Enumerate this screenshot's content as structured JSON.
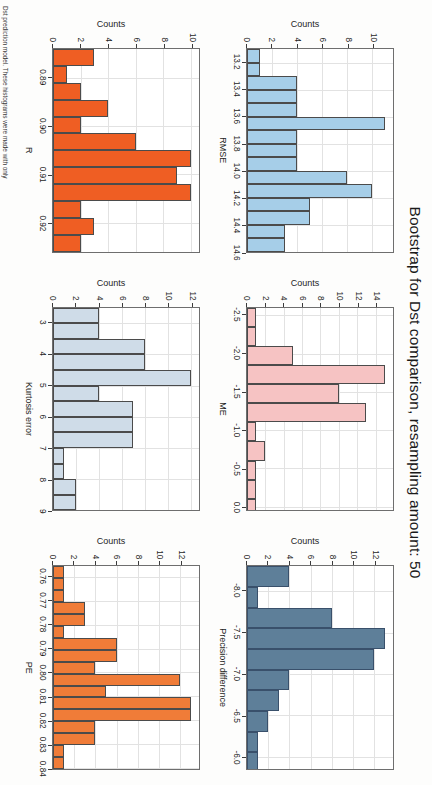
{
  "figure": {
    "title": "Bootstrap for Dst comparison, resampling amount: 50",
    "caption": "Dst prediction model. These histograms were made with only",
    "ylabel": "Counts"
  },
  "chart_data": [
    {
      "type": "bar",
      "panel_index": 0,
      "title": "",
      "xlabel": "RMSE",
      "ylabel": "Counts",
      "color": "#a6cee8",
      "border": "#4b4b4b",
      "xlim": [
        13.1,
        14.6
      ],
      "ylim": [
        0,
        11
      ],
      "yticks": [
        0,
        2,
        4,
        6,
        8,
        10
      ],
      "xticks": [
        13.2,
        13.4,
        13.6,
        13.8,
        14.0,
        14.2,
        14.4,
        14.6
      ],
      "xtick_labels": [
        "13.2",
        "13.4",
        "13.6",
        "13.8",
        "14.0",
        "14.2",
        "14.4",
        "14.6"
      ],
      "bin_width": 0.1,
      "bin_starts": [
        13.1,
        13.2,
        13.3,
        13.4,
        13.5,
        13.6,
        13.7,
        13.8,
        13.9,
        14.0,
        14.1,
        14.2,
        14.3,
        14.4,
        14.5
      ],
      "values": [
        1,
        1,
        4,
        4,
        4,
        11,
        4,
        4,
        4,
        8,
        10,
        5,
        5,
        3,
        3
      ],
      "grid": true
    },
    {
      "type": "bar",
      "panel_index": 1,
      "title": "",
      "xlabel": "ME",
      "ylabel": "Counts",
      "color": "#f6c3c3",
      "border": "#4b4b4b",
      "xlim": [
        -2.6,
        0.05
      ],
      "ylim": [
        0,
        15
      ],
      "yticks": [
        0,
        2,
        4,
        6,
        8,
        10,
        12,
        14
      ],
      "xticks": [
        -2.5,
        -2.0,
        -1.5,
        -1.0,
        -0.5,
        0.0
      ],
      "xtick_labels": [
        "-2.5",
        "-2.0",
        "-1.5",
        "-1.0",
        "-0.5",
        "0.0"
      ],
      "bin_width": 0.25,
      "bin_starts": [
        -2.6,
        -2.35,
        -2.1,
        -1.85,
        -1.6,
        -1.35,
        -1.1,
        -0.85,
        -0.6,
        -0.35,
        -0.1
      ],
      "values": [
        1,
        1,
        5,
        15,
        10,
        13,
        1,
        2,
        1,
        1,
        1
      ],
      "grid": true
    },
    {
      "type": "bar",
      "panel_index": 2,
      "title": "",
      "xlabel": "Precision difference",
      "ylabel": "Counts",
      "color": "#5e7f99",
      "border": "#39506b",
      "xlim": [
        -8.3,
        -5.85
      ],
      "ylim": [
        0,
        13
      ],
      "yticks": [
        0,
        2,
        4,
        6,
        8,
        10,
        12
      ],
      "xticks": [
        -8.0,
        -7.5,
        -7.0,
        -6.5,
        -6.0
      ],
      "xtick_labels": [
        "-8.0",
        "-7.5",
        "-7.0",
        "-6.5",
        "-6.0"
      ],
      "bin_width": 0.25,
      "bin_starts": [
        -8.3,
        -8.05,
        -7.8,
        -7.55,
        -7.3,
        -7.05,
        -6.8,
        -6.55,
        -6.3,
        -6.05
      ],
      "values": [
        4,
        1,
        8,
        13,
        12,
        4,
        3,
        2,
        1,
        1
      ],
      "grid": true
    },
    {
      "type": "bar",
      "panel_index": 3,
      "title": "",
      "xlabel": "R",
      "ylabel": "Counts",
      "color": "#ef5e23",
      "border": "#4b4b4b",
      "xlim": [
        0.884,
        0.926
      ],
      "ylim": [
        0,
        10
      ],
      "yticks": [
        0,
        2,
        4,
        6,
        8,
        10
      ],
      "xticks": [
        0.89,
        0.9,
        0.91,
        0.92
      ],
      "xtick_labels": [
        "0.89",
        "0.90",
        "0.91",
        "0.92"
      ],
      "bin_width": 0.0035,
      "bin_starts": [
        0.884,
        0.8875,
        0.891,
        0.8945,
        0.898,
        0.9015,
        0.905,
        0.9085,
        0.912,
        0.9155,
        0.919,
        0.9225
      ],
      "values": [
        3,
        1,
        2,
        4,
        2,
        6,
        10,
        9,
        10,
        2,
        3,
        2
      ],
      "grid": true
    },
    {
      "type": "bar",
      "panel_index": 4,
      "title": "",
      "xlabel": "Kurtosis error",
      "ylabel": "Counts",
      "color": "#cfdce8",
      "border": "#4b4b4b",
      "xlim": [
        2.5,
        9.0
      ],
      "ylim": [
        0,
        12
      ],
      "yticks": [
        0,
        2,
        4,
        6,
        8,
        10,
        12
      ],
      "xticks": [
        3,
        4,
        5,
        6,
        7,
        8,
        9
      ],
      "xtick_labels": [
        "3",
        "4",
        "5",
        "6",
        "7",
        "8",
        "9"
      ],
      "bin_width": 0.5,
      "bin_starts": [
        2.5,
        3.0,
        3.5,
        4.0,
        4.5,
        5.0,
        5.5,
        6.0,
        6.5,
        7.0,
        7.5,
        8.0,
        8.5
      ],
      "values": [
        4,
        4,
        8,
        8,
        12,
        4,
        7,
        7,
        7,
        1,
        1,
        2,
        2
      ],
      "grid": true
    },
    {
      "type": "bar",
      "panel_index": 5,
      "title": "",
      "xlabel": "PE",
      "ylabel": "Counts",
      "color": "#f07c38",
      "border": "#4b4b4b",
      "xlim": [
        0.7555,
        0.8405
      ],
      "ylim": [
        0,
        13
      ],
      "yticks": [
        0,
        2,
        4,
        6,
        8,
        10,
        12
      ],
      "xticks": [
        0.76,
        0.77,
        0.78,
        0.79,
        0.8,
        0.81,
        0.82,
        0.83,
        0.84
      ],
      "xtick_labels": [
        "0.76",
        "0.77",
        "0.78",
        "0.79",
        "0.80",
        "0.81",
        "0.82",
        "0.83",
        "0.84"
      ],
      "bin_width": 0.005,
      "bin_starts": [
        0.7555,
        0.7605,
        0.7655,
        0.7705,
        0.7755,
        0.7805,
        0.7855,
        0.7905,
        0.7955,
        0.8005,
        0.8055,
        0.8105,
        0.8155,
        0.8205,
        0.8255,
        0.8305,
        0.8355
      ],
      "values": [
        1,
        1,
        1,
        3,
        3,
        1,
        6,
        6,
        4,
        12,
        5,
        13,
        13,
        4,
        4,
        1,
        1
      ],
      "grid": true
    }
  ]
}
